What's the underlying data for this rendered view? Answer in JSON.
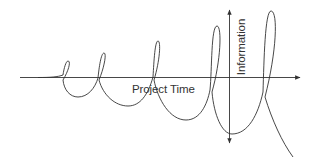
{
  "diagram": {
    "title": "",
    "axes": {
      "x_label": "Project Time",
      "y_label": "Information"
    },
    "colors": {
      "line": "#333333",
      "text": "#333333",
      "background": "#ffffff"
    }
  }
}
